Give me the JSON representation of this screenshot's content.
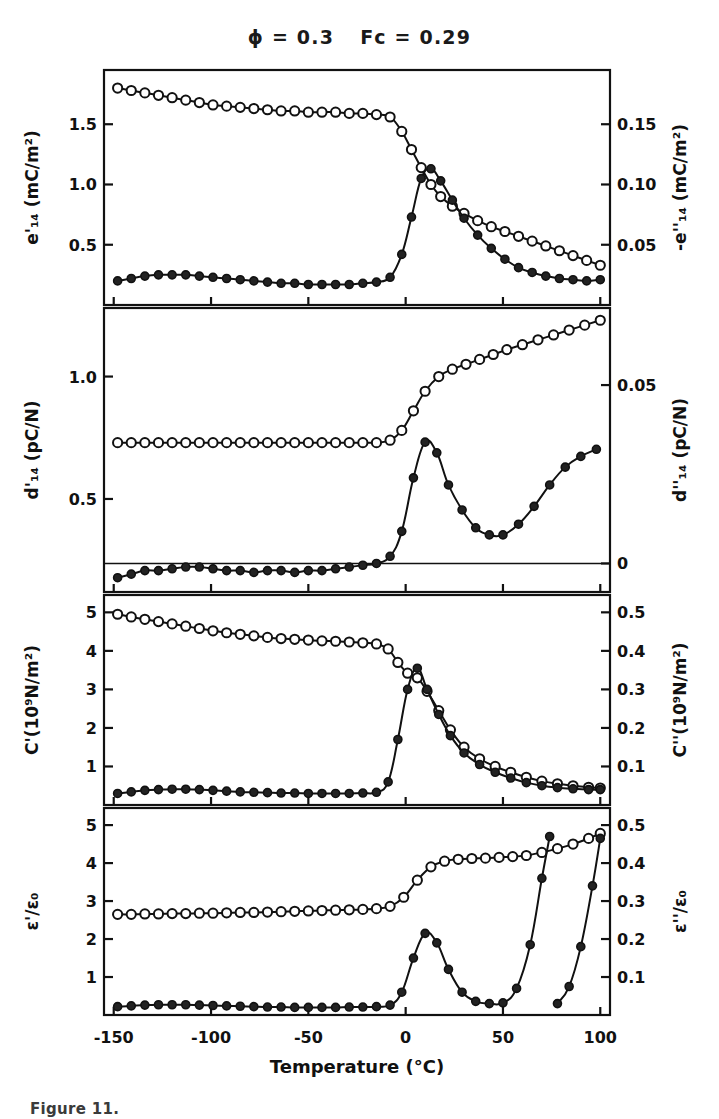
{
  "figure": {
    "title_phi": "ϕ = 0.3",
    "title_fc": "Fc = 0.29",
    "caption": "Figure 11.",
    "xlabel": "Temperature (°C)",
    "x_ticks": [
      "-150",
      "-100",
      "-50",
      "0",
      "50",
      "100"
    ],
    "x_values": [
      -150,
      -100,
      -50,
      0,
      50,
      100
    ],
    "xlim": [
      -155,
      105
    ],
    "ink_color": "#111111",
    "background_color": "#ffffff"
  },
  "chart_data": [
    {
      "type": "line",
      "panel": 1,
      "title": "",
      "xlabel": "Temperature (°C)",
      "ylabel": "e'₁₄ (mC/m²)",
      "ylabel_right": "-e''₁₄ (mC/m²)",
      "ylim": [
        0,
        1.95
      ],
      "ylim_right": [
        0,
        0.195
      ],
      "yticks": [
        0.5,
        1.0,
        1.5
      ],
      "ytick_labels": [
        "0.5",
        "1.0",
        "1.5"
      ],
      "yticks_right": [
        0.05,
        0.1,
        0.15
      ],
      "ytick_labels_right": [
        "0.05",
        "0.10",
        "0.15"
      ],
      "grid": false,
      "series": [
        {
          "name": "e'14",
          "marker": "open-circle",
          "axis": "left",
          "x": [
            -148,
            -141,
            -134,
            -127,
            -120,
            -113,
            -106,
            -99,
            -92,
            -85,
            -78,
            -71,
            -64,
            -57,
            -50,
            -43,
            -36,
            -29,
            -22,
            -15,
            -8,
            -2,
            3,
            8,
            13,
            18,
            24,
            30,
            37,
            44,
            51,
            58,
            65,
            72,
            79,
            86,
            93,
            100
          ],
          "y": [
            1.8,
            1.78,
            1.76,
            1.74,
            1.72,
            1.7,
            1.68,
            1.66,
            1.65,
            1.64,
            1.63,
            1.62,
            1.61,
            1.61,
            1.6,
            1.6,
            1.6,
            1.59,
            1.59,
            1.58,
            1.56,
            1.44,
            1.29,
            1.14,
            1.0,
            0.9,
            0.82,
            0.76,
            0.7,
            0.65,
            0.61,
            0.57,
            0.53,
            0.49,
            0.45,
            0.41,
            0.37,
            0.33
          ]
        },
        {
          "name": "-e''14",
          "marker": "filled-circle",
          "axis": "right",
          "x": [
            -148,
            -141,
            -134,
            -127,
            -120,
            -113,
            -106,
            -99,
            -92,
            -85,
            -78,
            -71,
            -64,
            -57,
            -50,
            -43,
            -36,
            -29,
            -22,
            -15,
            -8,
            -2,
            3,
            8,
            13,
            18,
            24,
            30,
            37,
            44,
            51,
            58,
            65,
            72,
            79,
            86,
            93,
            100
          ],
          "y": [
            0.02,
            0.022,
            0.024,
            0.025,
            0.025,
            0.025,
            0.024,
            0.023,
            0.022,
            0.021,
            0.02,
            0.019,
            0.018,
            0.018,
            0.017,
            0.017,
            0.017,
            0.017,
            0.018,
            0.019,
            0.023,
            0.042,
            0.073,
            0.105,
            0.113,
            0.103,
            0.087,
            0.072,
            0.058,
            0.047,
            0.038,
            0.031,
            0.027,
            0.024,
            0.022,
            0.021,
            0.02,
            0.021
          ]
        }
      ]
    },
    {
      "type": "line",
      "panel": 2,
      "title": "",
      "xlabel": "Temperature (°C)",
      "ylabel": "d'₁₄ (pC/N)",
      "ylabel_right": "d''₁₄ (pC/N)",
      "ylim": [
        0.12,
        1.28
      ],
      "ylim_right": [
        -0.008,
        0.0716
      ],
      "yticks": [
        0.5,
        1.0
      ],
      "ytick_labels": [
        "0.5",
        "1.0"
      ],
      "yticks_right": [
        0,
        0.05
      ],
      "ytick_labels_right": [
        "0",
        "0.05"
      ],
      "grid": false,
      "zero_line_right": 0,
      "series": [
        {
          "name": "d'14",
          "marker": "open-circle",
          "axis": "left",
          "x": [
            -148,
            -141,
            -134,
            -127,
            -120,
            -113,
            -106,
            -99,
            -92,
            -85,
            -78,
            -71,
            -64,
            -57,
            -50,
            -43,
            -36,
            -29,
            -22,
            -15,
            -8,
            -2,
            4,
            10,
            17,
            24,
            31,
            38,
            45,
            52,
            60,
            68,
            76,
            84,
            92,
            100
          ],
          "y": [
            0.73,
            0.73,
            0.73,
            0.73,
            0.73,
            0.73,
            0.73,
            0.73,
            0.73,
            0.73,
            0.73,
            0.73,
            0.73,
            0.73,
            0.73,
            0.73,
            0.73,
            0.73,
            0.73,
            0.73,
            0.74,
            0.78,
            0.86,
            0.94,
            1.0,
            1.03,
            1.05,
            1.07,
            1.09,
            1.11,
            1.13,
            1.15,
            1.17,
            1.19,
            1.21,
            1.23
          ]
        },
        {
          "name": "d''14",
          "marker": "filled-circle",
          "axis": "right",
          "x": [
            -148,
            -141,
            -134,
            -127,
            -120,
            -113,
            -106,
            -99,
            -92,
            -85,
            -78,
            -71,
            -64,
            -57,
            -50,
            -43,
            -36,
            -29,
            -22,
            -15,
            -8,
            -2,
            4,
            10,
            16,
            22,
            29,
            36,
            43,
            50,
            58,
            66,
            74,
            82,
            90,
            98
          ],
          "y": [
            -0.004,
            -0.003,
            -0.002,
            -0.002,
            -0.0015,
            -0.001,
            -0.001,
            -0.0015,
            -0.002,
            -0.002,
            -0.0025,
            -0.002,
            -0.002,
            -0.0025,
            -0.002,
            -0.002,
            -0.0015,
            -0.001,
            -0.0005,
            0.0,
            0.002,
            0.009,
            0.024,
            0.034,
            0.031,
            0.022,
            0.015,
            0.01,
            0.008,
            0.008,
            0.011,
            0.016,
            0.022,
            0.027,
            0.03,
            0.032
          ]
        }
      ]
    },
    {
      "type": "line",
      "panel": 3,
      "title": "",
      "xlabel": "Temperature (°C)",
      "ylabel": "C'(10⁹N/m²)",
      "ylabel_right": "C''(10⁹N/m²)",
      "ylim": [
        0,
        5.45
      ],
      "ylim_right": [
        0,
        0.545
      ],
      "yticks": [
        1,
        2,
        3,
        4,
        5
      ],
      "ytick_labels": [
        "1",
        "2",
        "3",
        "4",
        "5"
      ],
      "yticks_right": [
        0.1,
        0.2,
        0.3,
        0.4,
        0.5
      ],
      "ytick_labels_right": [
        "0.1",
        "0.2",
        "0.3",
        "0.4",
        "0.5"
      ],
      "grid": false,
      "series": [
        {
          "name": "C'",
          "marker": "open-circle",
          "axis": "left",
          "x": [
            -148,
            -141,
            -134,
            -127,
            -120,
            -113,
            -106,
            -99,
            -92,
            -85,
            -78,
            -71,
            -64,
            -57,
            -50,
            -43,
            -36,
            -29,
            -22,
            -15,
            -9,
            -4,
            1,
            6,
            11,
            17,
            23,
            30,
            38,
            46,
            54,
            62,
            70,
            78,
            86,
            94,
            100
          ],
          "y": [
            4.95,
            4.88,
            4.82,
            4.76,
            4.7,
            4.64,
            4.58,
            4.52,
            4.47,
            4.43,
            4.39,
            4.35,
            4.32,
            4.3,
            4.28,
            4.26,
            4.25,
            4.23,
            4.21,
            4.18,
            4.05,
            3.7,
            3.42,
            3.3,
            2.95,
            2.45,
            1.95,
            1.5,
            1.2,
            1.0,
            0.85,
            0.72,
            0.62,
            0.55,
            0.5,
            0.46,
            0.44
          ]
        },
        {
          "name": "C''",
          "marker": "filled-circle",
          "axis": "right",
          "x": [
            -148,
            -141,
            -134,
            -127,
            -120,
            -113,
            -106,
            -99,
            -92,
            -85,
            -78,
            -71,
            -64,
            -57,
            -50,
            -43,
            -36,
            -29,
            -22,
            -15,
            -9,
            -4,
            1,
            6,
            11,
            17,
            23,
            30,
            38,
            46,
            54,
            62,
            70,
            78,
            86,
            94,
            100
          ],
          "y": [
            0.03,
            0.034,
            0.038,
            0.04,
            0.041,
            0.041,
            0.04,
            0.038,
            0.036,
            0.034,
            0.033,
            0.032,
            0.031,
            0.031,
            0.03,
            0.03,
            0.03,
            0.03,
            0.031,
            0.033,
            0.06,
            0.17,
            0.3,
            0.355,
            0.3,
            0.235,
            0.18,
            0.135,
            0.105,
            0.085,
            0.07,
            0.058,
            0.05,
            0.045,
            0.042,
            0.04,
            0.04
          ]
        }
      ]
    },
    {
      "type": "line",
      "panel": 4,
      "title": "",
      "xlabel": "Temperature (°C)",
      "ylabel": "ε'/ε₀",
      "ylabel_right": "ε''/ε₀",
      "ylim": [
        0,
        5.45
      ],
      "ylim_right": [
        0,
        0.545
      ],
      "yticks": [
        1,
        2,
        3,
        4,
        5
      ],
      "ytick_labels": [
        "1",
        "2",
        "3",
        "4",
        "5"
      ],
      "yticks_right": [
        0.1,
        0.2,
        0.3,
        0.4,
        0.5
      ],
      "ytick_labels_right": [
        "0.1",
        "0.2",
        "0.3",
        "0.4",
        "0.5"
      ],
      "grid": false,
      "series": [
        {
          "name": "eps'/eps0",
          "marker": "open-circle",
          "axis": "left",
          "x": [
            -148,
            -141,
            -134,
            -127,
            -120,
            -113,
            -106,
            -99,
            -92,
            -85,
            -78,
            -71,
            -64,
            -57,
            -50,
            -43,
            -36,
            -29,
            -22,
            -15,
            -8,
            -1,
            6,
            13,
            20,
            27,
            34,
            41,
            48,
            55,
            62,
            70,
            78,
            86,
            94,
            100
          ],
          "y": [
            2.65,
            2.65,
            2.66,
            2.66,
            2.67,
            2.67,
            2.68,
            2.68,
            2.69,
            2.7,
            2.7,
            2.71,
            2.72,
            2.73,
            2.74,
            2.75,
            2.76,
            2.77,
            2.78,
            2.8,
            2.86,
            3.1,
            3.55,
            3.9,
            4.05,
            4.1,
            4.12,
            4.13,
            4.15,
            4.17,
            4.2,
            4.28,
            4.38,
            4.5,
            4.65,
            4.78
          ]
        },
        {
          "name": "eps''/eps0 (branch-1)",
          "marker": "filled-circle",
          "axis": "right",
          "x": [
            -148,
            -141,
            -134,
            -127,
            -120,
            -113,
            -106,
            -99,
            -92,
            -85,
            -78,
            -71,
            -64,
            -57,
            -50,
            -43,
            -36,
            -29,
            -22,
            -15,
            -8,
            -2,
            4,
            10,
            16,
            22,
            29,
            36,
            43,
            50,
            57,
            64,
            70,
            74
          ],
          "y": [
            0.022,
            0.024,
            0.026,
            0.027,
            0.027,
            0.027,
            0.026,
            0.025,
            0.024,
            0.023,
            0.022,
            0.021,
            0.021,
            0.02,
            0.02,
            0.02,
            0.02,
            0.021,
            0.021,
            0.022,
            0.026,
            0.06,
            0.15,
            0.215,
            0.19,
            0.12,
            0.06,
            0.036,
            0.03,
            0.032,
            0.07,
            0.185,
            0.36,
            0.47
          ]
        },
        {
          "name": "eps''/eps0 (branch-2)",
          "marker": "filled-circle",
          "axis": "right",
          "x": [
            78,
            84,
            90,
            96,
            100
          ],
          "y": [
            0.03,
            0.075,
            0.18,
            0.34,
            0.465
          ]
        }
      ]
    }
  ],
  "panels": [
    {
      "id": "panel-1",
      "ylabel_left": "e'₁₄ (mC/m²)",
      "ylabel_right": "-e''₁₄ (mC/m²)"
    },
    {
      "id": "panel-2",
      "ylabel_left": "d'₁₄ (pC/N)",
      "ylabel_right": "d''₁₄ (pC/N)"
    },
    {
      "id": "panel-3",
      "ylabel_left": "C'(10⁹N/m²)",
      "ylabel_right": "C''(10⁹N/m²)"
    },
    {
      "id": "panel-4",
      "ylabel_left": "ε'/ε₀",
      "ylabel_right": "ε''/ε₀"
    }
  ]
}
